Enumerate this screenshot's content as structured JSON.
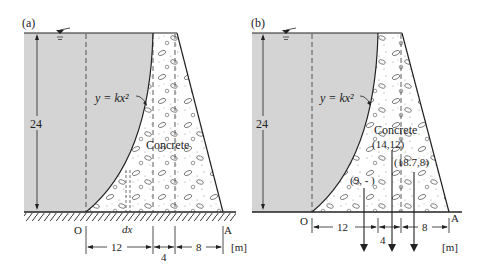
{
  "panels": [
    {
      "id": "a",
      "label": "(a)",
      "curve_label": "y = kx²",
      "material_label": "Concrete",
      "height_label": "24",
      "origin_label": "O",
      "end_label": "A",
      "element_label": "dx",
      "dims": [
        "12",
        "4",
        "8"
      ],
      "unit": "[m]"
    },
    {
      "id": "b",
      "label": "(b)",
      "curve_label": "y = kx²",
      "material_label": "Concrete",
      "height_label": "24",
      "origin_label": "O",
      "end_label": "A",
      "dims": [
        "12",
        "4",
        "8"
      ],
      "unit": "[m]",
      "centroids": [
        "(9, - )",
        "(14,12)",
        "(18.7,8)"
      ]
    }
  ],
  "colors": {
    "water": "#d4d4d4",
    "line": "#222222",
    "concrete": "#ffffff"
  }
}
